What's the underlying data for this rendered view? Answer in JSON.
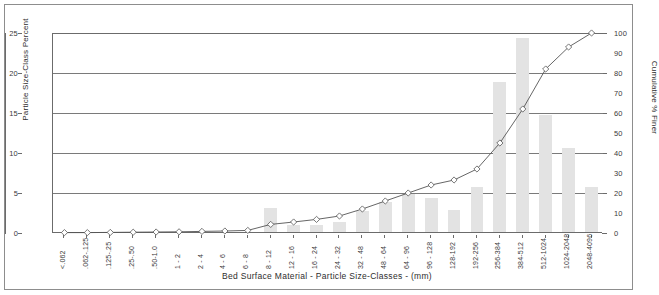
{
  "chart_data": {
    "type": "bar",
    "title": "",
    "xlabel": "Bed Surface Material  -   Particle Size-Classes  - (mm)",
    "ylabel": "Particle Size-Class Percent",
    "ylabel_secondary": "Cumulative % Finer",
    "ylim": [
      0,
      25
    ],
    "ylim_secondary": [
      0,
      100
    ],
    "yticks": [
      0,
      5,
      10,
      15,
      20,
      25
    ],
    "yticks_secondary": [
      0,
      10,
      20,
      30,
      40,
      50,
      60,
      70,
      80,
      90,
      100
    ],
    "grid": true,
    "legend": "none",
    "categories": [
      "<.062",
      ".062-.125",
      ".125-.25",
      ".25-.50",
      ".50-1.0",
      "1 - 2",
      "2 - 4",
      "4 - 6",
      "6 - 8",
      "8 - 12",
      "12 - 16",
      "16 - 24",
      "24 - 32",
      "32 - 48",
      "48 - 64",
      "64 - 96",
      "96 - 128",
      "128-192",
      "192-256",
      "256-384",
      "384-512",
      "512-1024",
      "1024-2048",
      "2048-4096"
    ],
    "series": [
      {
        "name": "Particle Size-Class Percent",
        "type": "bar",
        "axis": "left",
        "color": "#e3e3e3",
        "values": [
          0,
          0,
          0,
          0,
          0,
          0,
          0,
          0,
          0,
          3.0,
          0.9,
          0.9,
          1.2,
          2.6,
          3.7,
          4.7,
          4.2,
          2.7,
          5.6,
          18.8,
          24.2,
          14.6,
          10.5,
          5.6
        ]
      },
      {
        "name": "Cumulative % Finer",
        "type": "line",
        "axis": "right",
        "color": "#555555",
        "marker": "diamond",
        "values": [
          0.2,
          0.2,
          0.3,
          0.4,
          0.5,
          0.6,
          0.8,
          1.0,
          1.3,
          4.3,
          5.5,
          6.8,
          8.5,
          12.0,
          16.0,
          20.0,
          24.0,
          26.5,
          32.0,
          45.0,
          62.0,
          82.0,
          93.0,
          100.0
        ]
      }
    ]
  }
}
